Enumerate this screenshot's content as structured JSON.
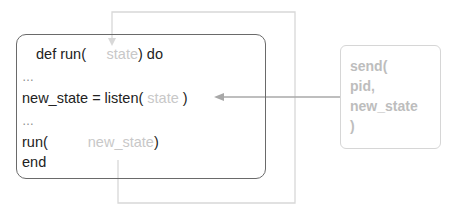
{
  "diagram": {
    "main_box": {
      "lines": {
        "def_prefix": "def run(",
        "def_arg": "state",
        "def_suffix": ") do",
        "ellipsis1": "…",
        "listen_prefix": "new_state = listen(",
        "listen_arg": " state ",
        "listen_suffix": ")",
        "ellipsis2": "…",
        "run_prefix": "run(",
        "run_arg": "new_state",
        "run_suffix": ")",
        "end": "end"
      }
    },
    "send_box": {
      "lines": [
        "send(",
        "pid,",
        "new_state",
        ")"
      ]
    },
    "colors": {
      "main_border": "#6a6a6a",
      "loop_line": "#d8d8d8",
      "send_arrow": "#a8a8a8",
      "faded_text": "#c8c8c8",
      "send_text": "#bdbdbd"
    }
  }
}
